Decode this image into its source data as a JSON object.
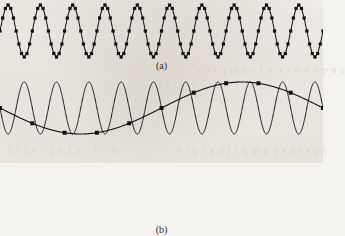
{
  "figure": {
    "kind": "signal-sampling-aliasing-illustration",
    "background_color": "#f4f2ee",
    "ink_color": "#181614",
    "marker_color": "#131110",
    "bleed_through": {
      "line_1": "s e q u e n c e   o f   s a m p l e s",
      "line_2": "d = 1 - x [ n ] = x ( t )",
      "line_3": "f o r   t h e   s a m p l i n g   r a t e",
      "line_4": "a l i a s e d"
    }
  },
  "panels": [
    {
      "id": "a",
      "caption": "(a)",
      "description": "Adequately sampled sinusoid: samples joined by straight line segments trace the original waveform as a zigzag.",
      "chart_data": {
        "type": "line",
        "title": "",
        "xlabel": "",
        "ylabel": "",
        "xlim": [
          0,
          323
        ],
        "ylim": [
          -1,
          1
        ],
        "grid": false,
        "legend": false,
        "series": [
          {
            "name": "sampled-signal-polyline",
            "style": "piecewise-linear",
            "cycles": 10,
            "samples_per_cycle": 12,
            "amplitude": 1.0,
            "phase_deg": 0,
            "markers": "square",
            "marker_size_px": 3.2
          }
        ]
      }
    },
    {
      "id": "b",
      "caption": "(b)",
      "description": "Undersampled sinusoid: the sparse samples lie on a much lower-frequency sinusoid, illustrating aliasing.",
      "chart_data": {
        "type": "line",
        "title": "",
        "xlabel": "",
        "ylabel": "",
        "xlim": [
          0,
          323
        ],
        "ylim": [
          -1,
          1
        ],
        "grid": false,
        "legend": false,
        "series": [
          {
            "name": "original-high-frequency-sinusoid",
            "style": "smooth",
            "cycles": 10,
            "amplitude": 1.0,
            "phase_deg": 180,
            "markers": "none"
          },
          {
            "name": "aliased-low-frequency-sinusoid",
            "style": "smooth",
            "cycles": 1,
            "amplitude": 1.0,
            "phase_deg": 180,
            "markers": "square",
            "marker_size_px": 4.0,
            "sample_count": 11
          }
        ]
      }
    }
  ]
}
